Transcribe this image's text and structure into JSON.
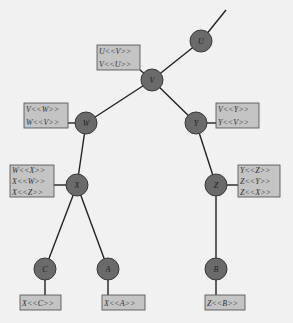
{
  "diagram": {
    "type": "tree",
    "colors": {
      "background": "#f1f1f1",
      "node_fill": "#6a6a6a",
      "box_fill": "#c4c4c4",
      "edge": "#222222"
    },
    "nodes": [
      {
        "id": "U",
        "label": "U",
        "cx": 201,
        "cy": 41
      },
      {
        "id": "V",
        "label": "V",
        "cx": 152,
        "cy": 80
      },
      {
        "id": "W",
        "label": "W",
        "cx": 86,
        "cy": 123
      },
      {
        "id": "Y",
        "label": "Y",
        "cx": 196,
        "cy": 123
      },
      {
        "id": "X",
        "label": "X",
        "cx": 77,
        "cy": 185
      },
      {
        "id": "Z",
        "label": "Z",
        "cx": 216,
        "cy": 185
      },
      {
        "id": "C",
        "label": "C",
        "cx": 45,
        "cy": 269
      },
      {
        "id": "A",
        "label": "A",
        "cx": 108,
        "cy": 269
      },
      {
        "id": "B",
        "label": "B",
        "cx": 216,
        "cy": 269
      }
    ],
    "edges": [
      {
        "from": "U",
        "to": "top",
        "x1": 201,
        "y1": 41,
        "x2": 226,
        "y2": 10
      },
      {
        "from": "U",
        "to": "V"
      },
      {
        "from": "V",
        "to": "W"
      },
      {
        "from": "V",
        "to": "Y"
      },
      {
        "from": "W",
        "to": "X"
      },
      {
        "from": "Y",
        "to": "Z"
      },
      {
        "from": "X",
        "to": "C"
      },
      {
        "from": "X",
        "to": "A"
      },
      {
        "from": "Z",
        "to": "B"
      }
    ],
    "label_boxes": [
      {
        "id": "box-V",
        "attached_to": "V",
        "x": 97,
        "y": 45,
        "w": 43,
        "h": 25,
        "lines": [
          "U<<V>>",
          "V<<U>>"
        ]
      },
      {
        "id": "box-W",
        "attached_to": "W",
        "x": 24,
        "y": 103,
        "w": 44,
        "h": 25,
        "lines": [
          "V<<W>>",
          "W<<V>>"
        ]
      },
      {
        "id": "box-Y",
        "attached_to": "Y",
        "x": 216,
        "y": 103,
        "w": 43,
        "h": 25,
        "lines": [
          "V<<Y>>",
          "Y<<V>>"
        ]
      },
      {
        "id": "box-X",
        "attached_to": "X",
        "x": 10,
        "y": 165,
        "w": 44,
        "h": 32,
        "lines": [
          "W<<X>>",
          "X<<W>>",
          "X<<Z>>"
        ]
      },
      {
        "id": "box-Z",
        "attached_to": "Z",
        "x": 238,
        "y": 165,
        "w": 42,
        "h": 32,
        "lines": [
          "Y<<Z>>",
          "Z<<Y>>",
          "Z<<X>>"
        ]
      },
      {
        "id": "box-C",
        "attached_to": "C",
        "x": 20,
        "y": 295,
        "w": 41,
        "h": 15,
        "lines": [
          "X<<C>>"
        ]
      },
      {
        "id": "box-A",
        "attached_to": "A",
        "x": 102,
        "y": 295,
        "w": 43,
        "h": 15,
        "lines": [
          "X<<A>>"
        ]
      },
      {
        "id": "box-B",
        "attached_to": "B",
        "x": 205,
        "y": 295,
        "w": 40,
        "h": 15,
        "lines": [
          "Z<<B>>"
        ]
      }
    ]
  }
}
